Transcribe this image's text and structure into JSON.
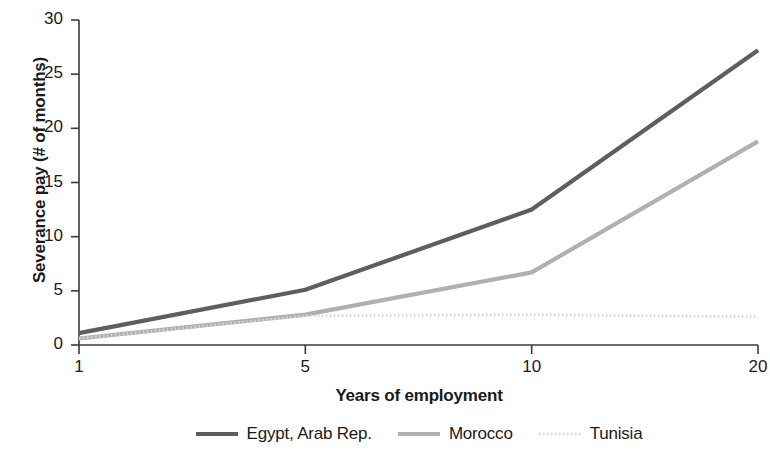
{
  "chart_data": {
    "type": "line",
    "title": "",
    "subtitle": "",
    "xlabel": "Years of employment",
    "ylabel": "Severance pay (# of months)",
    "x": [
      1,
      5,
      10,
      20
    ],
    "categories": [
      "1",
      "5",
      "10",
      "20"
    ],
    "xtick_labels": [
      "1",
      "5",
      "10",
      "20"
    ],
    "ytick_labels": [
      "0",
      "5",
      "10",
      "15",
      "20",
      "25",
      "30"
    ],
    "yticks": [
      0,
      5,
      10,
      15,
      20,
      25,
      30
    ],
    "ylim": [
      0,
      30
    ],
    "xlim_note": "categorical even spacing of 1, 5, 10, 20",
    "grid": false,
    "legend_position": "bottom-center",
    "series": [
      {
        "name": "Egypt, Arab Rep.",
        "values": [
          1.1,
          5.1,
          12.5,
          27.2
        ],
        "color": "#5e5e5e",
        "width": 4.2,
        "dash": "none"
      },
      {
        "name": "Morocco",
        "values": [
          0.6,
          2.8,
          6.7,
          18.8
        ],
        "color": "#b0b0b0",
        "width": 4.2,
        "dash": "none"
      },
      {
        "name": "Tunisia",
        "values": [
          0.6,
          2.7,
          2.8,
          2.6
        ],
        "color": "#d5d5d5",
        "width": 2.6,
        "dash": "dotted"
      }
    ]
  },
  "axes": {
    "y_title": "Severance pay (# of months)",
    "x_title": "Years of employment",
    "y_ticks": [
      "30",
      "25",
      "20",
      "15",
      "10",
      "5",
      "0"
    ],
    "x_ticks": [
      "1",
      "5",
      "10",
      "20"
    ],
    "axis_color": "#3a3a3a"
  },
  "legend": {
    "items": [
      {
        "label": "Egypt, Arab Rep."
      },
      {
        "label": "Morocco"
      },
      {
        "label": "Tunisia"
      }
    ]
  }
}
